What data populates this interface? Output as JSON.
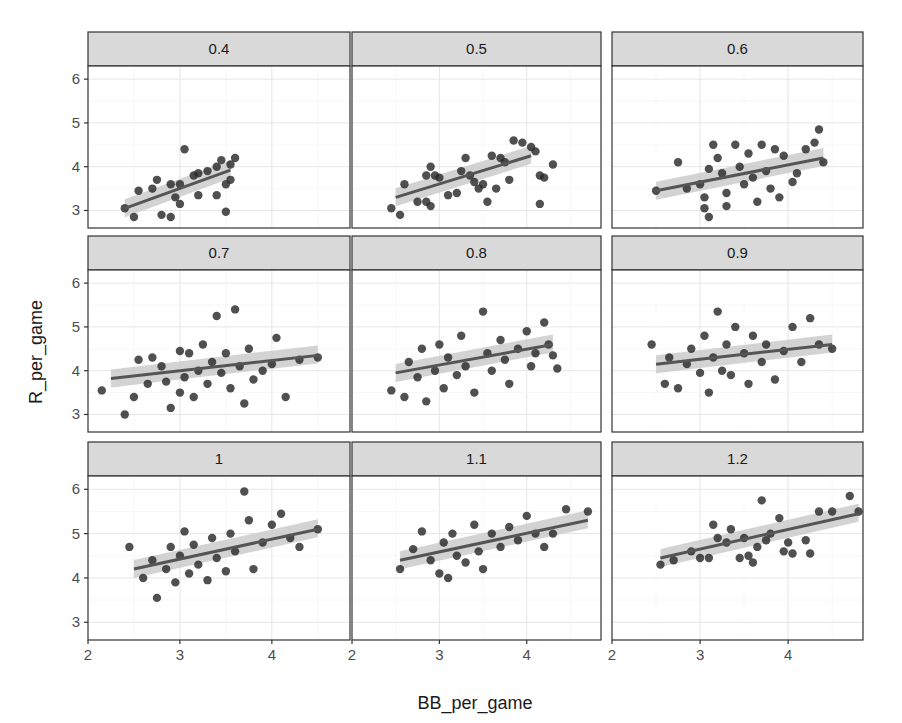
{
  "chart_data": {
    "type": "scatter",
    "title": "",
    "xlabel": "BB_per_game",
    "ylabel": "R_per_game",
    "xlim": [
      2,
      4.85
    ],
    "ylim": [
      2.6,
      6.3
    ],
    "x_ticks": [
      2,
      3,
      4
    ],
    "y_ticks": [
      3,
      4,
      5,
      6
    ],
    "grid": true,
    "facets": [
      {
        "label": "0.4",
        "fit": {
          "x0": 2.4,
          "y0": 3.05,
          "x1": 3.55,
          "y1": 3.92
        },
        "points": [
          [
            2.4,
            3.05
          ],
          [
            2.5,
            2.85
          ],
          [
            2.55,
            3.45
          ],
          [
            2.7,
            3.5
          ],
          [
            2.75,
            3.7
          ],
          [
            2.8,
            2.9
          ],
          [
            2.9,
            2.85
          ],
          [
            2.9,
            3.6
          ],
          [
            2.95,
            3.3
          ],
          [
            3.0,
            3.15
          ],
          [
            3.0,
            3.6
          ],
          [
            3.05,
            4.4
          ],
          [
            3.15,
            3.8
          ],
          [
            3.2,
            3.85
          ],
          [
            3.2,
            3.35
          ],
          [
            3.3,
            3.9
          ],
          [
            3.4,
            3.35
          ],
          [
            3.4,
            4.0
          ],
          [
            3.45,
            4.15
          ],
          [
            3.5,
            2.97
          ],
          [
            3.5,
            3.6
          ],
          [
            3.55,
            3.7
          ],
          [
            3.6,
            4.2
          ],
          [
            3.55,
            4.05
          ]
        ]
      },
      {
        "label": "0.5",
        "fit": {
          "x0": 2.5,
          "y0": 3.3,
          "x1": 4.05,
          "y1": 4.25
        },
        "points": [
          [
            2.45,
            3.05
          ],
          [
            2.55,
            2.9
          ],
          [
            2.6,
            3.6
          ],
          [
            2.75,
            3.2
          ],
          [
            2.85,
            3.2
          ],
          [
            2.9,
            3.1
          ],
          [
            2.85,
            3.8
          ],
          [
            2.9,
            4.0
          ],
          [
            2.95,
            3.8
          ],
          [
            3.0,
            3.75
          ],
          [
            3.1,
            3.35
          ],
          [
            3.2,
            3.4
          ],
          [
            3.25,
            3.9
          ],
          [
            3.35,
            3.8
          ],
          [
            3.4,
            3.65
          ],
          [
            3.45,
            3.5
          ],
          [
            3.5,
            3.6
          ],
          [
            3.55,
            3.2
          ],
          [
            3.6,
            4.25
          ],
          [
            3.7,
            4.2
          ],
          [
            3.75,
            4.1
          ],
          [
            3.8,
            3.7
          ],
          [
            3.85,
            4.6
          ],
          [
            3.95,
            4.55
          ],
          [
            4.05,
            4.45
          ],
          [
            4.1,
            4.35
          ],
          [
            4.15,
            3.8
          ],
          [
            4.15,
            3.15
          ],
          [
            4.2,
            3.75
          ],
          [
            4.3,
            4.05
          ],
          [
            3.3,
            4.2
          ],
          [
            3.65,
            3.5
          ]
        ]
      },
      {
        "label": "0.6",
        "fit": {
          "x0": 2.5,
          "y0": 3.45,
          "x1": 4.4,
          "y1": 4.2
        },
        "points": [
          [
            2.5,
            3.45
          ],
          [
            2.75,
            4.1
          ],
          [
            2.85,
            3.5
          ],
          [
            3.0,
            3.6
          ],
          [
            3.05,
            3.3
          ],
          [
            3.05,
            3.05
          ],
          [
            3.1,
            2.85
          ],
          [
            3.1,
            3.95
          ],
          [
            3.15,
            4.5
          ],
          [
            3.2,
            4.2
          ],
          [
            3.25,
            3.85
          ],
          [
            3.3,
            3.4
          ],
          [
            3.3,
            3.1
          ],
          [
            3.4,
            4.5
          ],
          [
            3.45,
            4.0
          ],
          [
            3.5,
            3.6
          ],
          [
            3.55,
            4.3
          ],
          [
            3.6,
            3.75
          ],
          [
            3.65,
            3.2
          ],
          [
            3.7,
            4.5
          ],
          [
            3.75,
            3.9
          ],
          [
            3.8,
            3.5
          ],
          [
            3.85,
            4.4
          ],
          [
            3.9,
            3.3
          ],
          [
            3.95,
            4.25
          ],
          [
            4.05,
            3.65
          ],
          [
            4.2,
            4.4
          ],
          [
            4.3,
            4.55
          ],
          [
            4.35,
            4.85
          ],
          [
            4.4,
            4.1
          ],
          [
            4.1,
            3.85
          ]
        ]
      },
      {
        "label": "0.7",
        "fit": {
          "x0": 2.25,
          "y0": 3.82,
          "x1": 4.5,
          "y1": 4.35
        },
        "points": [
          [
            2.15,
            3.55
          ],
          [
            2.4,
            3.0
          ],
          [
            2.5,
            3.4
          ],
          [
            2.55,
            4.25
          ],
          [
            2.65,
            3.7
          ],
          [
            2.7,
            4.3
          ],
          [
            2.8,
            4.1
          ],
          [
            2.85,
            3.75
          ],
          [
            2.9,
            3.15
          ],
          [
            3.0,
            4.45
          ],
          [
            3.0,
            3.5
          ],
          [
            3.05,
            3.85
          ],
          [
            3.1,
            4.4
          ],
          [
            3.15,
            3.4
          ],
          [
            3.2,
            4.0
          ],
          [
            3.25,
            4.6
          ],
          [
            3.3,
            3.7
          ],
          [
            3.35,
            4.2
          ],
          [
            3.4,
            5.25
          ],
          [
            3.45,
            3.95
          ],
          [
            3.5,
            4.4
          ],
          [
            3.55,
            3.6
          ],
          [
            3.6,
            5.4
          ],
          [
            3.65,
            4.1
          ],
          [
            3.7,
            3.25
          ],
          [
            3.75,
            4.5
          ],
          [
            3.8,
            3.8
          ],
          [
            3.9,
            4.0
          ],
          [
            4.0,
            4.15
          ],
          [
            4.05,
            4.75
          ],
          [
            4.15,
            3.4
          ],
          [
            4.3,
            4.25
          ],
          [
            4.5,
            4.3
          ]
        ]
      },
      {
        "label": "0.8",
        "fit": {
          "x0": 2.5,
          "y0": 3.95,
          "x1": 4.3,
          "y1": 4.6
        },
        "points": [
          [
            2.45,
            3.55
          ],
          [
            2.6,
            3.4
          ],
          [
            2.65,
            4.2
          ],
          [
            2.75,
            3.85
          ],
          [
            2.8,
            4.5
          ],
          [
            2.85,
            3.3
          ],
          [
            2.95,
            4.0
          ],
          [
            3.0,
            4.6
          ],
          [
            3.05,
            3.6
          ],
          [
            3.1,
            4.3
          ],
          [
            3.2,
            3.9
          ],
          [
            3.25,
            4.8
          ],
          [
            3.3,
            4.1
          ],
          [
            3.4,
            3.5
          ],
          [
            3.5,
            5.35
          ],
          [
            3.55,
            4.4
          ],
          [
            3.6,
            4.0
          ],
          [
            3.7,
            4.7
          ],
          [
            3.75,
            4.25
          ],
          [
            3.8,
            3.7
          ],
          [
            3.9,
            4.5
          ],
          [
            4.0,
            4.9
          ],
          [
            4.05,
            4.1
          ],
          [
            4.1,
            4.4
          ],
          [
            4.2,
            5.1
          ],
          [
            4.25,
            4.6
          ],
          [
            4.3,
            4.35
          ],
          [
            4.35,
            4.05
          ]
        ]
      },
      {
        "label": "0.9",
        "fit": {
          "x0": 2.5,
          "y0": 4.15,
          "x1": 4.5,
          "y1": 4.6
        },
        "points": [
          [
            2.45,
            4.6
          ],
          [
            2.6,
            3.7
          ],
          [
            2.65,
            4.3
          ],
          [
            2.75,
            3.6
          ],
          [
            2.85,
            4.15
          ],
          [
            2.9,
            4.5
          ],
          [
            3.0,
            3.95
          ],
          [
            3.05,
            4.8
          ],
          [
            3.1,
            3.5
          ],
          [
            3.15,
            4.3
          ],
          [
            3.2,
            5.35
          ],
          [
            3.25,
            4.0
          ],
          [
            3.3,
            4.6
          ],
          [
            3.35,
            3.9
          ],
          [
            3.4,
            5.0
          ],
          [
            3.5,
            4.4
          ],
          [
            3.55,
            3.7
          ],
          [
            3.6,
            4.8
          ],
          [
            3.7,
            4.2
          ],
          [
            3.75,
            4.6
          ],
          [
            3.85,
            3.8
          ],
          [
            3.95,
            4.45
          ],
          [
            4.05,
            5.0
          ],
          [
            4.15,
            4.2
          ],
          [
            4.25,
            5.2
          ],
          [
            4.35,
            4.6
          ],
          [
            4.5,
            4.5
          ]
        ]
      },
      {
        "label": "1",
        "fit": {
          "x0": 2.5,
          "y0": 4.2,
          "x1": 4.5,
          "y1": 5.1
        },
        "points": [
          [
            2.45,
            4.7
          ],
          [
            2.6,
            4.0
          ],
          [
            2.7,
            4.4
          ],
          [
            2.75,
            3.55
          ],
          [
            2.85,
            4.2
          ],
          [
            2.9,
            4.7
          ],
          [
            2.95,
            3.9
          ],
          [
            3.0,
            4.5
          ],
          [
            3.05,
            5.05
          ],
          [
            3.1,
            4.1
          ],
          [
            3.15,
            4.75
          ],
          [
            3.2,
            4.3
          ],
          [
            3.3,
            3.95
          ],
          [
            3.35,
            4.9
          ],
          [
            3.4,
            4.45
          ],
          [
            3.5,
            4.15
          ],
          [
            3.55,
            5.0
          ],
          [
            3.6,
            4.6
          ],
          [
            3.7,
            5.95
          ],
          [
            3.75,
            5.3
          ],
          [
            3.8,
            4.2
          ],
          [
            3.9,
            4.8
          ],
          [
            4.0,
            5.2
          ],
          [
            4.1,
            5.45
          ],
          [
            4.2,
            4.9
          ],
          [
            4.3,
            4.7
          ],
          [
            4.5,
            5.1
          ]
        ]
      },
      {
        "label": "1.1",
        "fit": {
          "x0": 2.55,
          "y0": 4.4,
          "x1": 4.7,
          "y1": 5.3
        },
        "points": [
          [
            2.55,
            4.2
          ],
          [
            2.7,
            4.65
          ],
          [
            2.8,
            5.05
          ],
          [
            2.9,
            4.4
          ],
          [
            3.0,
            4.1
          ],
          [
            3.05,
            4.8
          ],
          [
            3.1,
            4.0
          ],
          [
            3.15,
            5.0
          ],
          [
            3.2,
            4.5
          ],
          [
            3.3,
            4.35
          ],
          [
            3.4,
            5.2
          ],
          [
            3.45,
            4.6
          ],
          [
            3.5,
            4.2
          ],
          [
            3.6,
            5.0
          ],
          [
            3.7,
            4.7
          ],
          [
            3.8,
            5.15
          ],
          [
            3.9,
            4.85
          ],
          [
            4.0,
            5.4
          ],
          [
            4.1,
            5.0
          ],
          [
            4.2,
            4.7
          ],
          [
            4.3,
            5.0
          ],
          [
            4.45,
            5.55
          ],
          [
            4.7,
            5.5
          ]
        ]
      },
      {
        "label": "1.2",
        "fit": {
          "x0": 2.55,
          "y0": 4.45,
          "x1": 4.8,
          "y1": 5.45
        },
        "points": [
          [
            2.55,
            4.3
          ],
          [
            2.7,
            4.4
          ],
          [
            2.9,
            4.6
          ],
          [
            3.0,
            4.45
          ],
          [
            3.1,
            4.45
          ],
          [
            3.15,
            5.2
          ],
          [
            3.2,
            4.9
          ],
          [
            3.3,
            4.8
          ],
          [
            3.35,
            5.1
          ],
          [
            3.45,
            4.45
          ],
          [
            3.5,
            4.9
          ],
          [
            3.55,
            4.5
          ],
          [
            3.6,
            4.35
          ],
          [
            3.65,
            4.7
          ],
          [
            3.7,
            5.75
          ],
          [
            3.75,
            4.85
          ],
          [
            3.8,
            5.0
          ],
          [
            3.9,
            5.35
          ],
          [
            3.95,
            4.6
          ],
          [
            4.0,
            4.8
          ],
          [
            4.05,
            4.55
          ],
          [
            4.2,
            4.85
          ],
          [
            4.25,
            4.55
          ],
          [
            4.35,
            5.5
          ],
          [
            4.5,
            5.5
          ],
          [
            4.7,
            5.85
          ],
          [
            4.8,
            5.5
          ]
        ]
      }
    ]
  },
  "labels": {
    "xlabel": "BB_per_game",
    "ylabel": "R_per_game"
  }
}
